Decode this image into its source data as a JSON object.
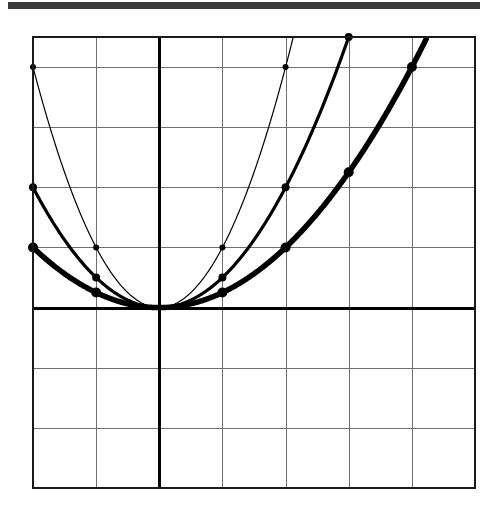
{
  "page": {
    "background_color": "#ffffff",
    "header_rule_color": "#3a3a3a"
  },
  "chart_data": {
    "type": "line",
    "title": "",
    "subtitle": "",
    "xlabel": "",
    "ylabel": "",
    "xlim": [
      -2,
      5
    ],
    "ylim": [
      -3,
      4.5
    ],
    "xticks": [
      -2,
      -1,
      0,
      1,
      2,
      3,
      4,
      5
    ],
    "yticks": [
      -3,
      -2,
      -1,
      0,
      1,
      2,
      3,
      4,
      4.5
    ],
    "xtick_labels": [
      "",
      "",
      "",
      "",
      "",
      "",
      "",
      ""
    ],
    "ytick_labels": [
      "",
      "",
      "",
      "",
      "",
      "",
      "",
      "",
      ""
    ],
    "grid": true,
    "grid_color": "#6e6e6e",
    "frame_color": "#1a1a1a",
    "axis_color": "#000000",
    "legend": "none",
    "annotations": [],
    "series": [
      {
        "name": "y = x^2",
        "style": "thin",
        "stroke_width": 1.2,
        "color": "#000000",
        "coefficient": 1,
        "marker": "dot",
        "marker_size": 3,
        "x": [
          -2,
          -1,
          0,
          1,
          2
        ],
        "values": [
          4,
          1,
          0,
          1,
          4
        ],
        "marker_x": [
          -2,
          -1,
          1,
          2
        ],
        "marker_y": [
          4,
          1,
          1,
          4
        ]
      },
      {
        "name": "y = x^2/2",
        "style": "medium",
        "stroke_width": 3.2,
        "color": "#000000",
        "coefficient": 0.5,
        "marker": "dot",
        "marker_size": 4,
        "x": [
          -2,
          -1,
          0,
          1,
          2,
          3
        ],
        "values": [
          2,
          0.5,
          0,
          0.5,
          2,
          4.5
        ],
        "marker_x": [
          -2,
          -1,
          1,
          2,
          3
        ],
        "marker_y": [
          2,
          0.5,
          0.5,
          2,
          4.5
        ]
      },
      {
        "name": "y = x^2/4",
        "style": "thick",
        "stroke_width": 5.5,
        "color": "#000000",
        "coefficient": 0.25,
        "marker": "dot",
        "marker_size": 5,
        "x": [
          -2,
          -1,
          0,
          1,
          2,
          3,
          4
        ],
        "values": [
          1,
          0.25,
          0,
          0.25,
          1,
          2.25,
          4
        ],
        "marker_x": [
          -2,
          -1,
          1,
          2,
          3,
          4
        ],
        "marker_y": [
          1,
          0.25,
          0.25,
          1,
          2.25,
          4
        ]
      }
    ]
  }
}
